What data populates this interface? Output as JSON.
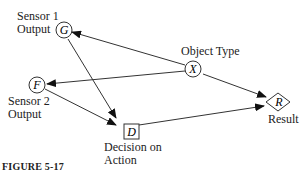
{
  "nodes": {
    "G": {
      "letter": "G",
      "label_line1": "Sensor 1",
      "label_line2": "Output",
      "shape": "circle"
    },
    "F": {
      "letter": "F",
      "label_line1": "Sensor 2",
      "label_line2": "Output",
      "shape": "circle"
    },
    "X": {
      "letter": "X",
      "label": "Object Type",
      "shape": "circle"
    },
    "D": {
      "letter": "D",
      "label_line1": "Decision on",
      "label_line2": "Action",
      "shape": "square"
    },
    "R": {
      "letter": "R",
      "label": "Result",
      "shape": "diamond"
    }
  },
  "edges": [
    {
      "from": "X",
      "to": "G"
    },
    {
      "from": "X",
      "to": "F"
    },
    {
      "from": "X",
      "to": "R"
    },
    {
      "from": "G",
      "to": "D"
    },
    {
      "from": "F",
      "to": "D"
    },
    {
      "from": "D",
      "to": "R"
    }
  ],
  "caption": "FIGURE 5-17"
}
